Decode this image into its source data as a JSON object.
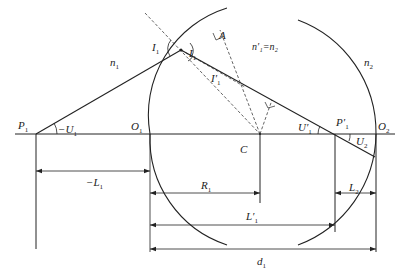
{
  "diagram": {
    "type": "optics-refraction-two-spherical-surfaces",
    "stroke_color": "#222222",
    "labels": {
      "P1": "P",
      "P1_sub": "1",
      "minus_U1": "−U",
      "minus_U1_sub": "1",
      "O1": "O",
      "O1_sub": "1",
      "n1": "n",
      "n1_sub": "1",
      "I1_incidence": "I",
      "I1_incidence_sub": "1",
      "I1_refraction_side": "I",
      "I1_refraction_side_sub": "1",
      "I1_prime": "I′",
      "I1_prime_sub": "1",
      "A": "A",
      "n1_prime_eq_n2": "n′₁=n₂",
      "n2": "n",
      "n2_sub": "2",
      "C": "C",
      "U1_prime": "U′",
      "U1_prime_sub": "1",
      "P1_prime": "P′",
      "P1_prime_sub": "1",
      "O2": "O",
      "O2_sub": "2",
      "U2": "U",
      "U2_sub": "2",
      "minus_L1": "−L",
      "minus_L1_sub": "1",
      "R1": "R",
      "R1_sub": "1",
      "L2": "L",
      "L2_sub": "2",
      "L1_prime": "L′",
      "L1_prime_sub": "1",
      "d1": "d",
      "d1_sub": "1"
    }
  }
}
